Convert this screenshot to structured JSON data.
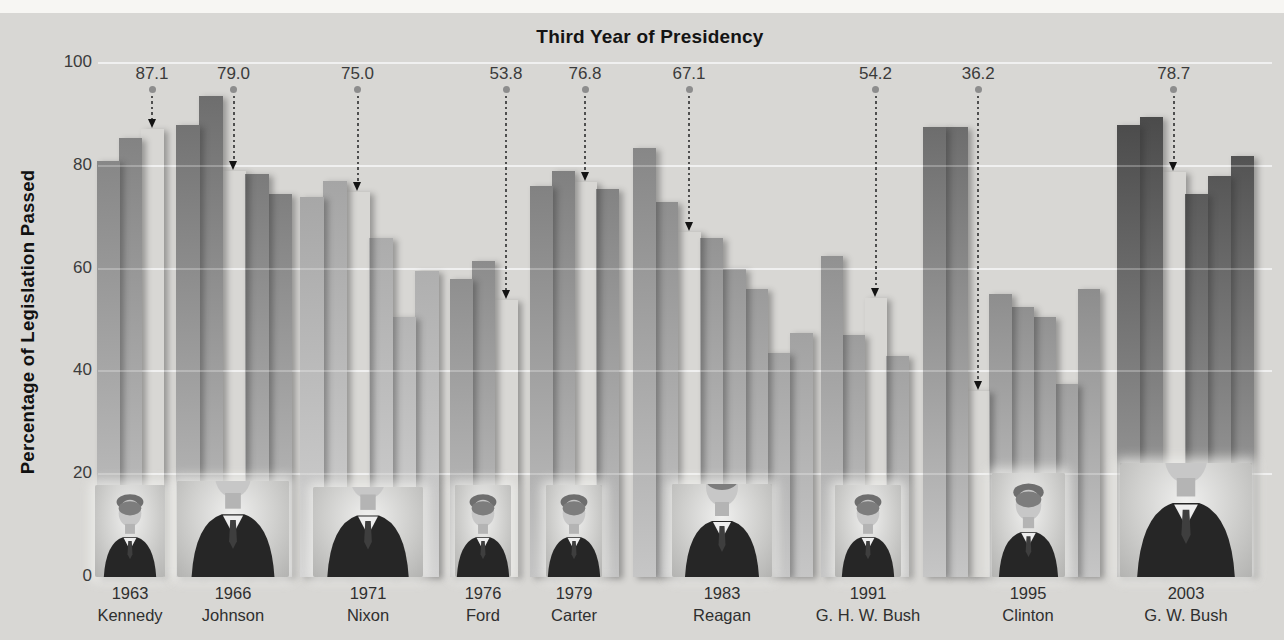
{
  "page": {
    "background_color": "#d8d7d4",
    "top_strip_color": "#f7f6f3",
    "gridline_color": "#ebebeb",
    "bar_bottom_fade_color": "#c6c6c6"
  },
  "header": {
    "title": "Third Year of Presidency"
  },
  "y_axis": {
    "title": "Percentage of Legislation Passed",
    "ticks": [
      100,
      80,
      60,
      40,
      20,
      0
    ]
  },
  "chart_data": {
    "type": "bar",
    "title": "Third Year of Presidency",
    "xlabel": "",
    "ylabel": "Percentage of Legislation Passed",
    "ylim": [
      0,
      100
    ],
    "yticks": [
      0,
      20,
      40,
      60,
      80,
      100
    ],
    "grid": true,
    "legend": "none",
    "annotation_style": "dotted arrow from value label down to third-year bar",
    "groups": [
      {
        "label_year": "1963",
        "label_president": "Kennedy",
        "photo_icon": "kennedy-photo",
        "bar_color": "#787878",
        "values": [
          81,
          85.5,
          87.1
        ],
        "third_year_index": 2,
        "third_year_value": 87.1
      },
      {
        "label_year": "1966",
        "label_president": "Johnson",
        "photo_icon": "johnson-photo",
        "bar_color": "#686868",
        "values": [
          88,
          93.5,
          79.0,
          78.5,
          74.5
        ],
        "third_year_index": 2,
        "third_year_value": 79.0
      },
      {
        "label_year": "1971",
        "label_president": "Nixon",
        "photo_icon": "nixon-photo",
        "bar_color": "#989898",
        "values": [
          74,
          77,
          75.0,
          66,
          50.5,
          59.5
        ],
        "third_year_index": 2,
        "third_year_value": 75.0
      },
      {
        "label_year": "1976",
        "label_president": "Ford",
        "photo_icon": "ford-photo",
        "bar_color": "#6a6a6a",
        "values": [
          58,
          61.5,
          53.8
        ],
        "third_year_index": 2,
        "third_year_value": 53.8
      },
      {
        "label_year": "1979",
        "label_president": "Carter",
        "photo_icon": "carter-photo",
        "bar_color": "#6e6e6e",
        "values": [
          76,
          79,
          76.8,
          75.5
        ],
        "third_year_index": 2,
        "third_year_value": 76.8
      },
      {
        "label_year": "1983",
        "label_president": "Reagan",
        "photo_icon": "reagan-photo",
        "bar_color": "#7a7a7a",
        "values": [
          83.5,
          73,
          67.1,
          66,
          60,
          56,
          43.5,
          47.5
        ],
        "third_year_index": 2,
        "third_year_value": 67.1
      },
      {
        "label_year": "1991",
        "label_president": "G. H. W. Bush",
        "photo_icon": "ghw-bush-photo",
        "bar_color": "#727272",
        "values": [
          62.5,
          47,
          54.2,
          43
        ],
        "third_year_index": 2,
        "third_year_value": 54.2
      },
      {
        "label_year": "1995",
        "label_president": "Clinton",
        "photo_icon": "clinton-photo",
        "bar_color": "#606060",
        "values": [
          87.5,
          87.5,
          36.2,
          55,
          52.5,
          50.5,
          37.5,
          56
        ],
        "third_year_index": 2,
        "third_year_value": 36.2
      },
      {
        "label_year": "2003",
        "label_president": "G. W. Bush",
        "photo_icon": "gw-bush-photo",
        "bar_color": "#404040",
        "values": [
          88,
          89.5,
          78.7,
          74.5,
          78,
          82
        ],
        "third_year_index": 2,
        "third_year_value": 78.7
      }
    ]
  }
}
